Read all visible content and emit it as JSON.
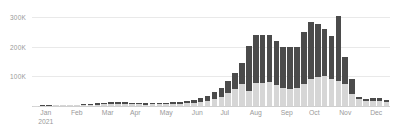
{
  "chart_data": {
    "type": "bar",
    "title": "",
    "subtitle": "",
    "xlabel": "",
    "ylabel": "",
    "stacked": true,
    "grid": true,
    "legend_position": "none",
    "ylim": [
      0,
      300000
    ],
    "yticks": [
      100000,
      200000,
      300000
    ],
    "ytick_labels": [
      "100K",
      "200K",
      "300K"
    ],
    "x_axis_type": "weekly",
    "x_tick_labels": [
      "Jan",
      "Feb",
      "Mar",
      "Apr",
      "May",
      "Jun",
      "Jul",
      "Aug",
      "Sep",
      "Oct",
      "Nov",
      "Dec"
    ],
    "x_axis_year": "2021",
    "colors": {
      "series_bottom": "#d6d6d6",
      "series_top": "#4b4b4b",
      "gridline": "#e9e9e9",
      "axis": "#cfcfcf",
      "tick_text": "#9a9a9a",
      "background": "#ffffff"
    },
    "categories": [
      "W1",
      "W2",
      "W3",
      "W4",
      "W5",
      "W6",
      "W7",
      "W8",
      "W9",
      "W10",
      "W11",
      "W12",
      "W13",
      "W14",
      "W15",
      "W16",
      "W17",
      "W18",
      "W19",
      "W20",
      "W21",
      "W22",
      "W23",
      "W24",
      "W25",
      "W26",
      "W27",
      "W28",
      "W29",
      "W30",
      "W31",
      "W32",
      "W33",
      "W34",
      "W35",
      "W36",
      "W37",
      "W38",
      "W39",
      "W40",
      "W41",
      "W42",
      "W43",
      "W44",
      "W45",
      "W46",
      "W47",
      "W48",
      "W49",
      "W50",
      "W51",
      "W52"
    ],
    "series": [
      {
        "name": "lower",
        "color": "#d6d6d6",
        "values": [
          1000,
          1200,
          1500,
          1800,
          2000,
          2400,
          2800,
          3200,
          4000,
          5000,
          6000,
          7000,
          8000,
          7000,
          6000,
          5500,
          5000,
          5200,
          5500,
          6000,
          7000,
          8000,
          9000,
          11000,
          14000,
          18000,
          24000,
          32000,
          44000,
          56000,
          74000,
          52000,
          76000,
          78000,
          80000,
          72000,
          62000,
          58000,
          60000,
          74000,
          92000,
          98000,
          100000,
          92000,
          84000,
          74000,
          40000,
          22000,
          16000,
          16000,
          18000,
          12000
        ]
      },
      {
        "name": "upper",
        "color": "#4b4b4b",
        "values": [
          600,
          800,
          1000,
          1200,
          1400,
          1700,
          2000,
          2400,
          3000,
          3800,
          4600,
          5400,
          6200,
          5200,
          4400,
          4000,
          3600,
          3800,
          4000,
          4400,
          5200,
          6000,
          7000,
          9000,
          12000,
          16000,
          22000,
          30000,
          42000,
          54000,
          72000,
          152000,
          162000,
          160000,
          160000,
          148000,
          136000,
          140000,
          140000,
          176000,
          190000,
          180000,
          158000,
          144000,
          220000,
          90000,
          50000,
          8000,
          8000,
          10000,
          10000,
          8000
        ]
      }
    ],
    "totals": [
      1600,
      2000,
      2500,
      3000,
      3400,
      4100,
      4800,
      5600,
      7000,
      8800,
      10600,
      12400,
      14200,
      12200,
      10400,
      9500,
      8600,
      9000,
      9500,
      10400,
      12200,
      14000,
      16000,
      20000,
      26000,
      34000,
      46000,
      62000,
      86000,
      110000,
      146000,
      204000,
      238000,
      238000,
      240000,
      220000,
      198000,
      198000,
      200000,
      250000,
      282000,
      278000,
      258000,
      236000,
      304000,
      164000,
      90000,
      30000,
      24000,
      26000,
      28000,
      20000
    ]
  }
}
